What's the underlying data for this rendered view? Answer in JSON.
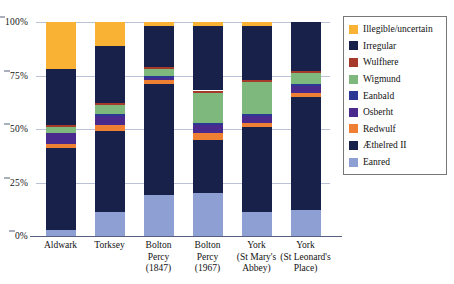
{
  "chart_data": {
    "type": "bar",
    "subtype": "stacked-percentage-column",
    "title": "",
    "subtitle": "",
    "xlabel": "",
    "ylabel": "",
    "ylim": [
      0,
      100
    ],
    "yticks": [
      "0%",
      "25%",
      "50%",
      "75%",
      "100%"
    ],
    "ytick_values": [
      0,
      25,
      50,
      75,
      100
    ],
    "grid": true,
    "legend_position": "right",
    "stack_order_bottom_to_top": [
      "Eanred",
      "Æthelred II",
      "Redwulf",
      "Osberht",
      "Eanbald",
      "Wigmund",
      "Wulfhere",
      "Irregular",
      "Illegible/uncertain"
    ],
    "categories": [
      "Aldwark",
      "Torksey",
      "Bolton Percy (1847)",
      "Bolton Percy (1967)",
      "York (St Mary's Abbey)",
      "York (St Leonard's Place)"
    ],
    "series": [
      {
        "name": "Eanred",
        "color": "#8e9fd4",
        "values": [
          3,
          11,
          19,
          20,
          11,
          12
        ]
      },
      {
        "name": "Æthelred II",
        "color": "#17214a",
        "values": [
          38,
          38,
          52,
          25,
          40,
          53
        ]
      },
      {
        "name": "Redwulf",
        "color": "#ef8033",
        "values": [
          2,
          3,
          2,
          3,
          2,
          2
        ]
      },
      {
        "name": "Osberht",
        "color": "#4a2a8c",
        "values": [
          5,
          4,
          1,
          4,
          3,
          3
        ]
      },
      {
        "name": "Eanbald",
        "color": "#2b3894",
        "values": [
          0,
          1,
          1,
          1,
          1,
          1
        ]
      },
      {
        "name": "Wigmund",
        "color": "#7fb87d",
        "values": [
          3,
          4,
          3,
          14,
          15,
          5
        ]
      },
      {
        "name": "Wulfhere",
        "color": "#a63a2a",
        "values": [
          1,
          1,
          1,
          1,
          1,
          1
        ]
      },
      {
        "name": "Irregular",
        "color": "#17214a",
        "values": [
          26,
          27,
          19,
          30,
          25,
          23
        ]
      },
      {
        "name": "Illegible/uncertain",
        "color": "#f9b233",
        "values": [
          22,
          11,
          2,
          2,
          2,
          0
        ]
      }
    ]
  },
  "legend": {
    "entries": [
      {
        "label": "Illegible/uncertain",
        "color": "#f9b233"
      },
      {
        "label": "Irregular",
        "color": "#17214a"
      },
      {
        "label": "Wulfhere",
        "color": "#a63a2a"
      },
      {
        "label": "Wigmund",
        "color": "#7fb87d"
      },
      {
        "label": "Eanbald",
        "color": "#2b3894"
      },
      {
        "label": "Osberht",
        "color": "#4a2a8c"
      },
      {
        "label": "Redwulf",
        "color": "#ef8033"
      },
      {
        "label": "Æthelred II",
        "color": "#17214a"
      },
      {
        "label": "Eanred",
        "color": "#8e9fd4"
      }
    ]
  },
  "xaxis": {
    "labels": [
      [
        "Aldwark"
      ],
      [
        "Torksey"
      ],
      [
        "Bolton",
        "Percy",
        "(1847)"
      ],
      [
        "Bolton",
        "Percy",
        "(1967)"
      ],
      [
        "York",
        "(St Mary's",
        "Abbey)"
      ],
      [
        "York",
        "(St Leonard's",
        "Place)"
      ]
    ]
  },
  "colors": {
    "gridline": "#b9c2d6",
    "axis": "#55617c",
    "legend_border": "#777777",
    "background": "#ffffff",
    "text": "#121212"
  }
}
